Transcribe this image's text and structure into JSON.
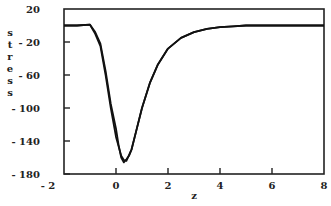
{
  "chart_data": {
    "type": "line",
    "title": "",
    "xlabel": "z",
    "ylabel": "stress",
    "xlim": [
      -2,
      8
    ],
    "ylim": [
      -180,
      20
    ],
    "xticks": [
      "- 2",
      "0",
      "2",
      "4",
      "6",
      "8"
    ],
    "xtick_values": [
      -2,
      0,
      2,
      4,
      6,
      8
    ],
    "yticks": [
      "20",
      "- 20",
      "- 60",
      "- 100",
      "- 140",
      "- 180"
    ],
    "ytick_values": [
      20,
      -20,
      -60,
      -100,
      -140,
      -180
    ],
    "grid": false,
    "legend": null,
    "series": [
      {
        "name": "stress curve A",
        "x": [
          -2,
          -1.5,
          -1.0,
          -0.8,
          -0.6,
          -0.4,
          -0.2,
          0.0,
          0.2,
          0.3,
          0.4,
          0.6,
          0.8,
          1.0,
          1.3,
          1.6,
          2.0,
          2.5,
          3.0,
          3.5,
          4.0,
          4.5,
          5.0,
          6.0,
          7.0,
          8.0
        ],
        "y": [
          0,
          0,
          1,
          -10,
          -25,
          -60,
          -100,
          -135,
          -158,
          -163,
          -164,
          -150,
          -125,
          -100,
          -70,
          -48,
          -28,
          -15,
          -8,
          -4,
          -2,
          -1,
          0,
          0,
          0,
          0
        ]
      },
      {
        "name": "stress curve B",
        "x": [
          -2,
          -1.5,
          -1.0,
          -0.8,
          -0.6,
          -0.4,
          -0.2,
          0.0,
          0.1,
          0.2,
          0.3,
          0.4,
          0.5,
          0.6,
          0.8,
          1.0,
          1.3,
          1.6,
          2.0,
          2.5,
          3.0,
          3.5,
          4.0,
          4.5,
          5.0,
          6.0,
          7.0,
          8.0
        ],
        "y": [
          0,
          0,
          1,
          -8,
          -22,
          -55,
          -95,
          -125,
          -145,
          -160,
          -166,
          -162,
          -158,
          -150,
          -125,
          -100,
          -70,
          -48,
          -28,
          -15,
          -8,
          -4,
          -2,
          -1,
          0,
          0,
          0,
          0
        ]
      }
    ]
  }
}
